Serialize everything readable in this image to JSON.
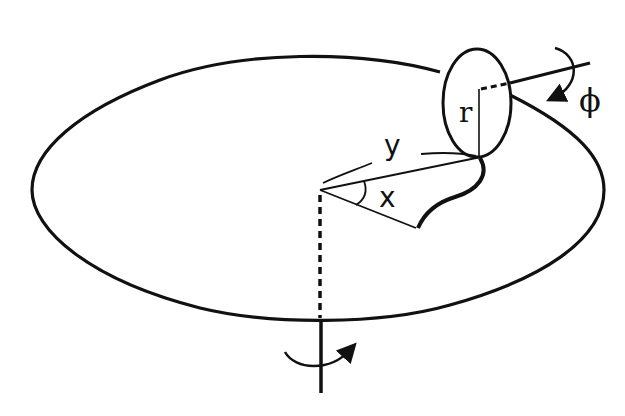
{
  "diagram": {
    "colors": {
      "stroke": "#111111",
      "background": "#ffffff"
    },
    "labels": {
      "r": "r",
      "phi": "ϕ",
      "y": "y",
      "x": "x"
    },
    "elements": [
      "turntable-ellipse",
      "wheel-ellipse",
      "wheel-axle",
      "wheel-radius",
      "vertical-rotation-axis",
      "contact-path-curve",
      "angle-x-arc",
      "rotation-arrow-phi",
      "rotation-arrow-axis"
    ]
  }
}
